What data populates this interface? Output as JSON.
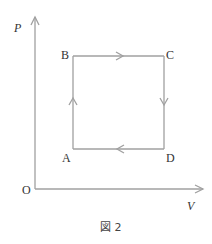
{
  "diagram": {
    "type": "P-V cycle diagram",
    "axes": {
      "y_label": "P",
      "x_label": "V",
      "origin_label": "O"
    },
    "points": [
      {
        "id": "A",
        "label": "A",
        "position": "bottom-left"
      },
      {
        "id": "B",
        "label": "B",
        "position": "top-left"
      },
      {
        "id": "C",
        "label": "C",
        "position": "top-right"
      },
      {
        "id": "D",
        "label": "D",
        "position": "bottom-right"
      }
    ],
    "cycle": [
      "A",
      "B",
      "C",
      "D",
      "A"
    ],
    "edges": [
      {
        "from": "A",
        "to": "B",
        "direction": "up",
        "process": "isochoric"
      },
      {
        "from": "B",
        "to": "C",
        "direction": "right",
        "process": "isobaric"
      },
      {
        "from": "C",
        "to": "D",
        "direction": "down",
        "process": "isochoric"
      },
      {
        "from": "D",
        "to": "A",
        "direction": "left",
        "process": "isobaric"
      }
    ],
    "caption": "図 2",
    "colors": {
      "line": "#a0a0a0",
      "text": "#333333"
    }
  }
}
